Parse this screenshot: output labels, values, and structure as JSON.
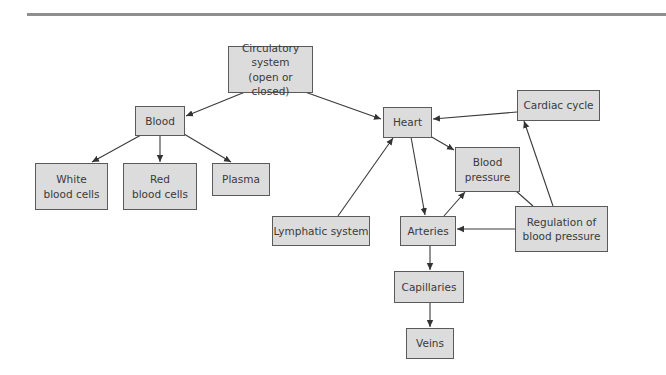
{
  "diagram": {
    "title_rule_color": "#8f8f8f",
    "node_fill": "#dcdcdc",
    "node_border": "#5a5a5a",
    "nodes": {
      "circulatory": {
        "label": "Circulatory system\n(open or closed)"
      },
      "blood": {
        "label": "Blood"
      },
      "white": {
        "label": "White\nblood cells"
      },
      "red": {
        "label": "Red\nblood cells"
      },
      "plasma": {
        "label": "Plasma"
      },
      "heart": {
        "label": "Heart"
      },
      "cardiac": {
        "label": "Cardiac cycle"
      },
      "bp": {
        "label": "Blood\npressure"
      },
      "lymph": {
        "label": "Lymphatic system"
      },
      "arteries": {
        "label": "Arteries"
      },
      "regulation": {
        "label": "Regulation of\nblood pressure"
      },
      "capillaries": {
        "label": "Capillaries"
      },
      "veins": {
        "label": "Veins"
      }
    },
    "edges": [
      {
        "from": "Circulatory system",
        "to": "Blood"
      },
      {
        "from": "Circulatory system",
        "to": "Heart"
      },
      {
        "from": "Blood",
        "to": "White blood cells"
      },
      {
        "from": "Blood",
        "to": "Red blood cells"
      },
      {
        "from": "Blood",
        "to": "Plasma"
      },
      {
        "from": "Cardiac cycle",
        "to": "Heart"
      },
      {
        "from": "Heart",
        "to": "Blood pressure"
      },
      {
        "from": "Heart",
        "to": "Arteries"
      },
      {
        "from": "Lymphatic system",
        "to": "Heart"
      },
      {
        "from": "Arteries",
        "to": "Blood pressure"
      },
      {
        "from": "Regulation of blood pressure",
        "to": "Arteries"
      },
      {
        "from": "Regulation of blood pressure",
        "to": "Cardiac cycle"
      },
      {
        "from": "Regulation of blood pressure",
        "to": "Blood pressure",
        "arrow": false
      },
      {
        "from": "Arteries",
        "to": "Capillaries"
      },
      {
        "from": "Capillaries",
        "to": "Veins"
      }
    ]
  }
}
